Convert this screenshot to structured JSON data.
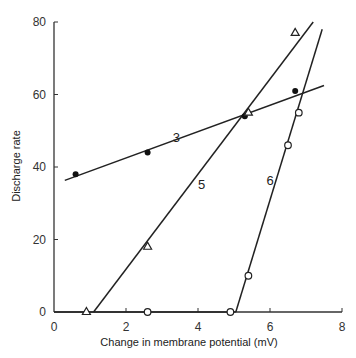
{
  "chart_data": {
    "type": "scatter",
    "title": "",
    "xlabel": "Change in membrane potential (mV)",
    "ylabel": "Discharge rate",
    "xlim": [
      0,
      8
    ],
    "ylim": [
      0,
      80
    ],
    "xticks": [
      0,
      2,
      4,
      6,
      8
    ],
    "yticks": [
      0,
      20,
      40,
      60,
      80
    ],
    "grid": false,
    "legend": "none",
    "series": [
      {
        "name": "3",
        "marker": "filled-circle",
        "points": [
          [
            0.6,
            38
          ],
          [
            2.6,
            44
          ],
          [
            5.3,
            54
          ],
          [
            6.7,
            61
          ]
        ],
        "fit_line": [
          [
            0.3,
            36.3
          ],
          [
            7.5,
            62.5
          ]
        ]
      },
      {
        "name": "5",
        "marker": "open-triangle",
        "points": [
          [
            0.9,
            0
          ],
          [
            2.6,
            18
          ],
          [
            5.4,
            55
          ],
          [
            6.7,
            77
          ]
        ],
        "fit_line": [
          [
            1.1,
            0
          ],
          [
            7.2,
            80
          ]
        ]
      },
      {
        "name": "6",
        "marker": "open-circle",
        "points": [
          [
            2.6,
            0
          ],
          [
            4.9,
            0
          ],
          [
            5.4,
            10
          ],
          [
            6.5,
            46
          ],
          [
            6.8,
            55
          ]
        ],
        "fit_line": [
          [
            5.05,
            0
          ],
          [
            7.45,
            78
          ]
        ],
        "baseline": [
          [
            0,
            0
          ],
          [
            5.05,
            0
          ]
        ]
      }
    ],
    "annotations": [
      {
        "text": "3",
        "x": 3.4,
        "y": 47
      },
      {
        "text": "5",
        "x": 4.1,
        "y": 34
      },
      {
        "text": "6",
        "x": 6.0,
        "y": 35
      }
    ]
  }
}
